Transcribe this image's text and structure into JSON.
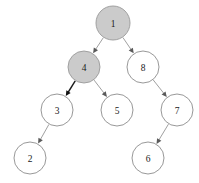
{
  "figure": {
    "width": 199,
    "height": 183,
    "background_color": "#ffffff"
  },
  "style": {
    "node_radius": 16,
    "filled_fill_color": "#cbcbcb",
    "filled_stroke_color": "#9a9a9a",
    "hollow_fill_color": "#ffffff",
    "hollow_stroke_color": "#8c8c8c",
    "edge_color": "#8f8f8f",
    "edge_emphasis_color": "#1c1c1c",
    "label_color": "#1a1a1a"
  },
  "chart_data": {
    "type": "diagram",
    "diagram_kind": "binary-tree",
    "title": "",
    "directed": true,
    "nodes": [
      {
        "id": "n1",
        "label": "1",
        "x": 113,
        "y": 23,
        "r": 17,
        "fill": "gray",
        "level": 0
      },
      {
        "id": "n4",
        "label": "4",
        "x": 84,
        "y": 67,
        "r": 16,
        "fill": "gray",
        "level": 1
      },
      {
        "id": "n8",
        "label": "8",
        "x": 143,
        "y": 67,
        "r": 16,
        "fill": "white",
        "level": 1
      },
      {
        "id": "n3",
        "label": "3",
        "x": 57,
        "y": 110,
        "r": 16,
        "fill": "white",
        "level": 2
      },
      {
        "id": "n5",
        "label": "5",
        "x": 117,
        "y": 110,
        "r": 16,
        "fill": "white",
        "level": 2
      },
      {
        "id": "n7",
        "label": "7",
        "x": 177,
        "y": 110,
        "r": 16,
        "fill": "white",
        "level": 2
      },
      {
        "id": "n2",
        "label": "2",
        "x": 30,
        "y": 158,
        "r": 16,
        "fill": "white",
        "level": 3
      },
      {
        "id": "n6",
        "label": "6",
        "x": 148,
        "y": 158,
        "r": 16,
        "fill": "white",
        "level": 3
      }
    ],
    "edges": [
      {
        "from": "n1",
        "to": "n4",
        "side": "left",
        "emphasis": false
      },
      {
        "from": "n1",
        "to": "n8",
        "side": "right",
        "emphasis": false
      },
      {
        "from": "n4",
        "to": "n3",
        "side": "left",
        "emphasis": true
      },
      {
        "from": "n4",
        "to": "n5",
        "side": "right",
        "emphasis": false
      },
      {
        "from": "n8",
        "to": "n7",
        "side": "right",
        "emphasis": false
      },
      {
        "from": "n3",
        "to": "n2",
        "side": "left",
        "emphasis": false
      },
      {
        "from": "n7",
        "to": "n6",
        "side": "left",
        "emphasis": false
      }
    ],
    "highlighted_nodes": [
      "1",
      "4"
    ],
    "node_labels": [
      "1",
      "4",
      "8",
      "3",
      "5",
      "7",
      "2",
      "6"
    ],
    "annotations": []
  }
}
